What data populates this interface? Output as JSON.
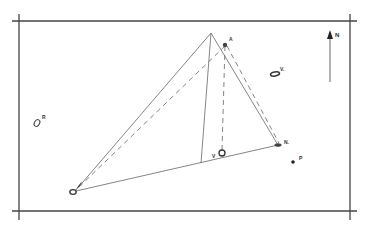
{
  "diagram": {
    "type": "survey-triangulation-sketch",
    "colors": {
      "ink": "#555555",
      "dark": "#333333",
      "background": "#ffffff"
    },
    "frame": {
      "left": 19,
      "top": 21,
      "right": 350,
      "bottom": 211
    },
    "north_arrow": {
      "label": "N",
      "x": 330,
      "y_top": 30,
      "y_bottom": 82
    },
    "apex": {
      "x": 211,
      "y": 33
    },
    "points": [
      {
        "id": "A",
        "label": "A",
        "x": 225,
        "y": 45,
        "shape": "dot"
      },
      {
        "id": "V",
        "label": "V",
        "x": 222,
        "y": 153,
        "shape": "ring"
      },
      {
        "id": "N1",
        "label": "N.",
        "x": 278,
        "y": 145,
        "shape": "ellipse"
      },
      {
        "id": "P",
        "label": "P",
        "x": 293,
        "y": 162,
        "shape": "dot"
      },
      {
        "id": "V2",
        "label": "V.",
        "x": 275,
        "y": 74,
        "shape": "ellipse"
      },
      {
        "id": "R",
        "label": "R",
        "x": 37,
        "y": 122,
        "shape": "ring"
      },
      {
        "id": "X",
        "label": "",
        "x": 73,
        "y": 191,
        "shape": "ring"
      }
    ],
    "labels": {
      "A": "A",
      "V": "V",
      "N1": "N.",
      "P": "P",
      "V2": "V.",
      "R": "R",
      "north": "N"
    }
  }
}
